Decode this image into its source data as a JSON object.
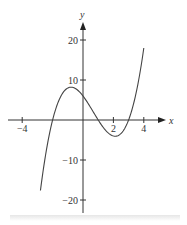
{
  "chart_data": {
    "type": "line",
    "title": "",
    "xlabel": "x",
    "ylabel": "y",
    "function": "f(x) = x^3 - 2x^2 - 5x + 6",
    "xlim": [
      -4.5,
      5
    ],
    "ylim": [
      -23,
      25
    ],
    "x_ticks": [
      -4,
      2,
      4
    ],
    "x_tick_labels": [
      "−4",
      "2",
      "4"
    ],
    "y_ticks": [
      20,
      10,
      -10,
      -20
    ],
    "y_tick_labels": [
      "20",
      "10",
      "−10",
      "−20"
    ],
    "grid": false,
    "legend": null,
    "series": [
      {
        "name": "f(x)",
        "x": [
          -2.8,
          -2.5,
          -2,
          -1.5,
          -1,
          -0.5,
          0,
          0.5,
          1,
          1.5,
          2,
          2.5,
          3,
          3.5,
          4
        ],
        "y": [
          -19.8,
          -11.4,
          0,
          5.6,
          8,
          7.9,
          6,
          3.1,
          0,
          -2.6,
          -4,
          -3.4,
          0,
          6.9,
          18
        ]
      }
    ],
    "annotations": {
      "roots": [
        -2,
        1,
        3
      ],
      "local_max": [
        -1,
        8
      ],
      "local_min": [
        2,
        -4
      ]
    }
  }
}
